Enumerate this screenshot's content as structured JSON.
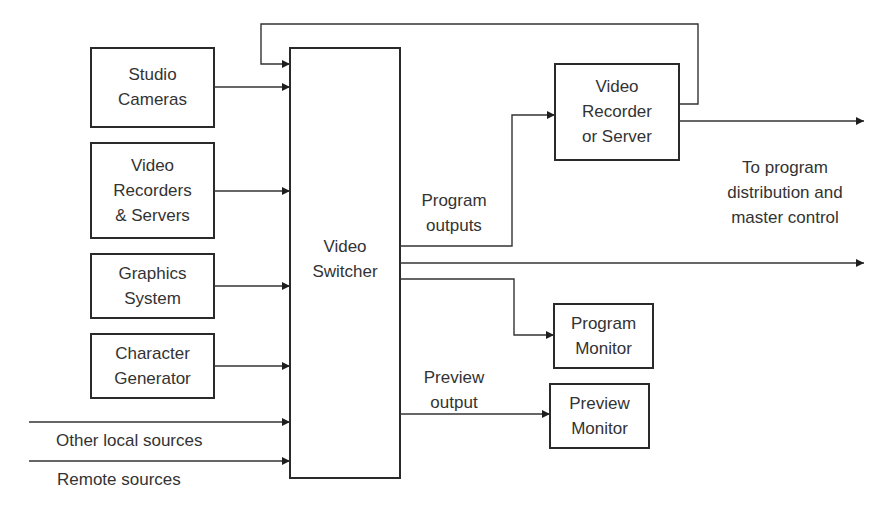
{
  "diagram": {
    "sources": [
      {
        "id": "studio-cameras",
        "label": "Studio\nCameras"
      },
      {
        "id": "video-recorders",
        "label": "Video\nRecorders\n& Servers"
      },
      {
        "id": "graphics-system",
        "label": "Graphics\nSystem"
      },
      {
        "id": "character-generator",
        "label": "Character\nGenerator"
      }
    ],
    "external_inputs": {
      "other_local": "Other local sources",
      "remote": "Remote sources"
    },
    "switcher": {
      "label": "Video\nSwitcher"
    },
    "outputs": {
      "program_outputs": "Program\noutputs",
      "preview_output": "Preview\noutput",
      "distribution": "To program\ndistribution and\nmaster control"
    },
    "destinations": [
      {
        "id": "video-recorder-server",
        "label": "Video\nRecorder\nor Server"
      },
      {
        "id": "program-monitor",
        "label": "Program\nMonitor"
      },
      {
        "id": "preview-monitor",
        "label": "Preview\nMonitor"
      }
    ]
  }
}
